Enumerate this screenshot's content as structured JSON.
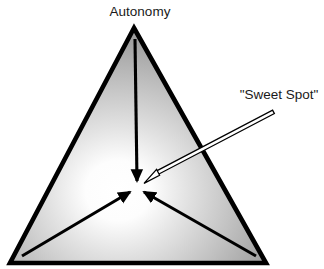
{
  "figure": {
    "labels": {
      "apex_label": "Autonomy",
      "callout_label": "\"Sweet Spot\""
    },
    "colors": {
      "background": "#ffffff",
      "outline": "#000000",
      "text": "#1a1a1a",
      "gradient_center": "#ffffff",
      "gradient_mid": "#bdbdbd",
      "gradient_edge": "#8a8a8a",
      "callout_arrow_fill": "#ffffff",
      "callout_arrow_stroke": "#000000"
    },
    "geometry": {
      "triangle_apex": [
        134,
        28
      ],
      "triangle_bottom_left": [
        10,
        263
      ],
      "triangle_bottom_right": [
        266,
        263
      ],
      "convergence_point": [
        137,
        186
      ],
      "callout_arrow_tail": [
        272,
        112
      ],
      "callout_arrow_tip": [
        144,
        183
      ]
    },
    "arrows": [
      {
        "name": "arrow-from-apex",
        "from": [
          135,
          40
        ],
        "to": [
          137,
          182
        ]
      },
      {
        "name": "arrow-from-bottom-left",
        "from": [
          24,
          255
        ],
        "to": [
          131,
          191
        ]
      },
      {
        "name": "arrow-from-bottom-right",
        "from": [
          254,
          255
        ],
        "to": [
          143,
          191
        ]
      }
    ]
  }
}
